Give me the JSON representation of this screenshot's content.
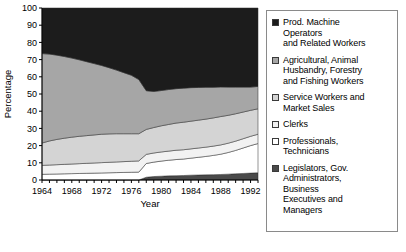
{
  "chart_data": {
    "type": "area",
    "title": "",
    "xlabel": "Year",
    "ylabel": "Percentage",
    "xlim": [
      1964,
      1993
    ],
    "ylim": [
      0,
      100
    ],
    "grid": false,
    "stacked": true,
    "legend_position": "right",
    "ytick_labels": [
      "0",
      "10",
      "20",
      "30",
      "40",
      "50",
      "60",
      "70",
      "80",
      "90",
      "100"
    ],
    "yticks": [
      0,
      10,
      20,
      30,
      40,
      50,
      60,
      70,
      80,
      90,
      100
    ],
    "xtick_labels": [
      "1964",
      "1968",
      "1972",
      "1976",
      "1980",
      "1984",
      "1988",
      "1992"
    ],
    "xticks_labeled": [
      1964,
      1968,
      1972,
      1976,
      1980,
      1984,
      1988,
      1992
    ],
    "x": [
      1964,
      1965,
      1966,
      1967,
      1968,
      1969,
      1970,
      1971,
      1972,
      1973,
      1974,
      1975,
      1976,
      1977,
      1978,
      1979,
      1980,
      1981,
      1982,
      1983,
      1984,
      1985,
      1986,
      1987,
      1988,
      1989,
      1990,
      1991,
      1992,
      1993
    ],
    "series": [
      {
        "name": "Legislators, Gov. Administrators, Business Executives and Managers",
        "color": "#4a4a4a",
        "values": [
          0,
          0,
          0,
          0,
          0,
          0,
          0,
          0,
          0,
          0,
          0,
          0,
          0,
          0,
          1.6,
          2.0,
          2.2,
          2.4,
          2.5,
          2.6,
          2.8,
          2.9,
          3.0,
          3.1,
          3.2,
          3.4,
          3.6,
          3.8,
          4.0,
          4.2
        ]
      },
      {
        "name": "Professionals, Technicians",
        "color": "#ffffff",
        "values": [
          3.3,
          3.4,
          3.5,
          3.6,
          3.7,
          3.8,
          3.9,
          4.0,
          4.1,
          4.2,
          4.3,
          4.4,
          4.5,
          4.6,
          8.0,
          8.4,
          8.8,
          9.1,
          9.4,
          9.6,
          9.9,
          10.3,
          10.7,
          11.2,
          11.8,
          12.6,
          13.6,
          14.8,
          16.0,
          17.0
        ]
      },
      {
        "name": "Clerks",
        "color": "#f2f2f2",
        "values": [
          5.2,
          5.3,
          5.4,
          5.5,
          5.6,
          5.7,
          5.8,
          5.9,
          6.0,
          6.1,
          6.2,
          6.3,
          6.4,
          6.5,
          5.3,
          5.3,
          5.3,
          5.3,
          5.4,
          5.4,
          5.4,
          5.4,
          5.4,
          5.4,
          5.4,
          5.4,
          5.4,
          5.4,
          5.4,
          5.4
        ]
      },
      {
        "name": "Service Workers and Market Sales",
        "color": "#d4d4d4",
        "values": [
          13.0,
          14.0,
          14.7,
          15.2,
          15.6,
          15.9,
          16.1,
          16.3,
          16.5,
          16.5,
          16.4,
          16.2,
          16.0,
          15.8,
          14.5,
          14.8,
          15.2,
          15.5,
          15.8,
          16.0,
          16.1,
          16.2,
          16.3,
          16.4,
          16.5,
          16.2,
          15.9,
          15.5,
          15.1,
          14.8
        ]
      },
      {
        "name": "Agricultural, Animal Husbandry, Forestry and Fishing Workers",
        "color": "#a6a6a6",
        "values": [
          52.0,
          50.5,
          49.0,
          47.5,
          46.0,
          44.5,
          43.0,
          41.5,
          40.0,
          38.5,
          37.0,
          35.5,
          34.0,
          31.5,
          22.5,
          21.0,
          20.5,
          20.3,
          20.0,
          19.8,
          19.5,
          19.0,
          18.5,
          17.8,
          17.2,
          16.4,
          15.5,
          14.5,
          13.5,
          13.0
        ]
      },
      {
        "name": "Prod. Machine Operators and Related Workers",
        "color": "#1c1c1c",
        "values": [
          26.5,
          26.8,
          27.4,
          28.2,
          29.1,
          30.1,
          31.2,
          32.3,
          33.4,
          34.7,
          36.1,
          37.6,
          39.1,
          41.6,
          48.1,
          48.5,
          48.0,
          47.4,
          46.9,
          46.6,
          46.3,
          46.2,
          46.1,
          46.1,
          45.9,
          46.0,
          46.0,
          46.0,
          46.0,
          45.6
        ]
      }
    ]
  },
  "legend": {
    "items": [
      {
        "label": "Prod. Machine\nOperators\nand Related Workers",
        "color": "#1c1c1c"
      },
      {
        "label": "Agricultural, Animal\nHusbandry, Forestry\nand Fishing Workers",
        "color": "#a6a6a6"
      },
      {
        "label": "Service Workers and\nMarket Sales",
        "color": "#d4d4d4"
      },
      {
        "label": "Clerks",
        "color": "#f2f2f2"
      },
      {
        "label": "Professionals,\nTechnicians",
        "color": "#ffffff"
      },
      {
        "label": "Legislators, Gov.\nAdministrators,\nBusiness\nExecutives and\nManagers",
        "color": "#4a4a4a"
      }
    ]
  }
}
